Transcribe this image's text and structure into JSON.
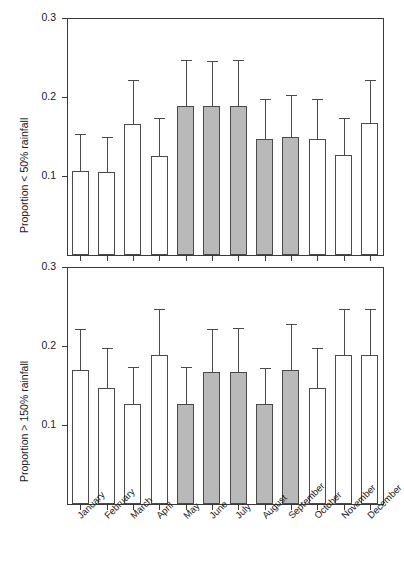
{
  "chart_data": {
    "type": "bar",
    "title": "",
    "xlabel": "",
    "categories": [
      "January",
      "February",
      "March",
      "April",
      "May",
      "June",
      "July",
      "August",
      "September",
      "October",
      "November",
      "December"
    ],
    "panels": [
      {
        "id": "panel-top",
        "ylabel": "Proportion < 50% rainfall",
        "ylim": [
          0,
          0.3
        ],
        "yticks": [
          0.1,
          0.2,
          0.3
        ],
        "ytick_labels": [
          "0.1",
          "0.2",
          "0.3"
        ],
        "grid": false,
        "legend": "",
        "series": [
          {
            "name": "Proportion < 50% rainfall",
            "values": [
              0.106,
              0.105,
              0.166,
              0.125,
              0.188,
              0.188,
              0.188,
              0.147,
              0.149,
              0.147,
              0.126,
              0.167
            ],
            "err_upper": [
              0.153,
              0.15,
              0.221,
              0.173,
              0.247,
              0.246,
              0.247,
              0.198,
              0.202,
              0.198,
              0.173,
              0.221
            ],
            "shaded": [
              false,
              false,
              false,
              false,
              true,
              true,
              true,
              true,
              true,
              false,
              false,
              false
            ]
          }
        ]
      },
      {
        "id": "panel-bottom",
        "ylabel": "Proportion > 150% rainfall",
        "ylim": [
          0,
          0.3
        ],
        "yticks": [
          0.1,
          0.2,
          0.3
        ],
        "ytick_labels": [
          "0.1",
          "0.2",
          "0.3"
        ],
        "grid": false,
        "legend": "",
        "series": [
          {
            "name": "Proportion > 150% rainfall",
            "values": [
              0.17,
              0.147,
              0.126,
              0.188,
              0.126,
              0.167,
              0.167,
              0.126,
              0.17,
              0.147,
              0.189,
              0.189
            ],
            "err_upper": [
              0.221,
              0.198,
              0.173,
              0.247,
              0.173,
              0.221,
              0.223,
              0.172,
              0.228,
              0.198,
              0.247,
              0.247
            ],
            "shaded": [
              false,
              false,
              false,
              false,
              true,
              true,
              true,
              true,
              true,
              false,
              false,
              false
            ]
          }
        ]
      }
    ],
    "colors": {
      "shaded_bar": "#b9b9b9",
      "open_bar": "#ffffff",
      "axis": "#3a3a3a",
      "bar_outline": "#4a4a4a"
    }
  }
}
